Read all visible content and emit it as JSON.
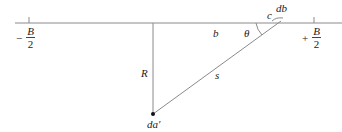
{
  "diagram": {
    "type": "geometry-figure",
    "colors": {
      "line": "#888888",
      "text": "#222222",
      "dot": "#111111"
    },
    "labels": {
      "left_bound": {
        "sign": "−",
        "numerator": "B",
        "denominator": "2"
      },
      "right_bound": {
        "sign": "+",
        "numerator": "B",
        "denominator": "2"
      },
      "distance_b": "b",
      "angle": "θ",
      "corner": "c",
      "element": "db",
      "height": "R",
      "slant": "s",
      "point": "da′"
    }
  }
}
